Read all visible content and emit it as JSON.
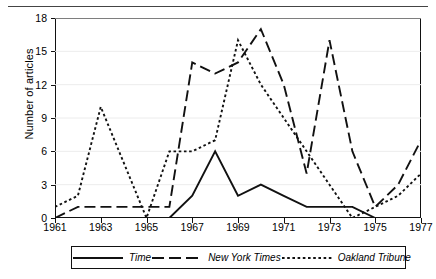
{
  "chart_data": {
    "type": "line",
    "title": "",
    "xlabel": "",
    "ylabel": "Number of articles",
    "x": [
      1961,
      1962,
      1963,
      1964,
      1965,
      1966,
      1967,
      1968,
      1969,
      1970,
      1971,
      1972,
      1973,
      1974,
      1975,
      1976,
      1977
    ],
    "xlim": [
      1961,
      1977
    ],
    "ylim": [
      0,
      18
    ],
    "xticks": [
      1961,
      1963,
      1965,
      1967,
      1969,
      1971,
      1973,
      1975,
      1977
    ],
    "xtick_labels": [
      "1961",
      "1963",
      "1965",
      "1967",
      "1969",
      "1971",
      "1973",
      "1975",
      "1977"
    ],
    "yticks": [
      0,
      3,
      6,
      9,
      12,
      15,
      18
    ],
    "ytick_labels": [
      "0",
      "3",
      "6",
      "9",
      "12",
      "15",
      "18"
    ],
    "grid": true,
    "legend_position": "bottom",
    "series": [
      {
        "name": "Time",
        "style": "solid",
        "color": "#111111",
        "values": [
          0,
          0,
          0,
          0,
          0,
          0,
          2,
          6,
          2,
          3,
          2,
          1,
          1,
          1,
          0,
          0,
          0
        ]
      },
      {
        "name": "New York Times",
        "style": "long-dash",
        "color": "#111111",
        "values": [
          0,
          1,
          1,
          1,
          1,
          1,
          14,
          13,
          14,
          17,
          12,
          4,
          16,
          6,
          1,
          3,
          7
        ]
      },
      {
        "name": "Oakland Tribune",
        "style": "dotted",
        "color": "#111111",
        "values": [
          1,
          2,
          10,
          5,
          0,
          6,
          6,
          7,
          16,
          12,
          9,
          6,
          3,
          0,
          1,
          2,
          4
        ]
      }
    ]
  },
  "axis": {
    "y_title": "Number of articles"
  },
  "legend": {
    "entries": [
      {
        "label": "Time",
        "swatch": "solid-line-swatch"
      },
      {
        "label": "New York Times",
        "swatch": "long-dash-line-swatch"
      },
      {
        "label": "Oakland Tribune",
        "swatch": "dotted-line-swatch"
      }
    ]
  }
}
